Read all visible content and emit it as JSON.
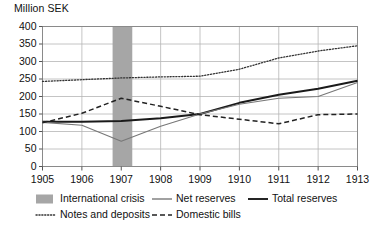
{
  "chart_data": {
    "type": "line",
    "title": "",
    "ylabel": "Million SEK",
    "xlabel": "",
    "ylim": [
      0,
      400
    ],
    "ytick_step": 50,
    "yticks": [
      0,
      50,
      100,
      150,
      200,
      250,
      300,
      350,
      400
    ],
    "xlim": [
      1905,
      1913
    ],
    "x": [
      1905,
      1906,
      1907,
      1908,
      1909,
      1910,
      1911,
      1912,
      1913
    ],
    "categories": [
      "1905",
      "1906",
      "1907",
      "1908",
      "1909",
      "1910",
      "1911",
      "1912",
      "1913"
    ],
    "grid": true,
    "grid_axis": "both",
    "legend_position": "bottom",
    "series": [
      {
        "name": "Notes and deposits",
        "style": "dotted",
        "color": "#333333",
        "values": [
          243,
          248,
          253,
          256,
          258,
          278,
          310,
          330,
          345
        ]
      },
      {
        "name": "Total reserves",
        "style": "solid-thick",
        "color": "#1a1a1a",
        "values": [
          128,
          128,
          130,
          138,
          150,
          182,
          205,
          222,
          245
        ]
      },
      {
        "name": "Net reserves",
        "style": "solid-thin",
        "color": "#777777",
        "values": [
          126,
          118,
          72,
          115,
          150,
          178,
          195,
          200,
          240
        ]
      },
      {
        "name": "Domestic bills",
        "style": "dashed",
        "color": "#222222",
        "values": [
          125,
          152,
          195,
          172,
          148,
          135,
          122,
          148,
          150
        ]
      }
    ],
    "bands": [
      {
        "name": "International crisis",
        "color": "#a6a6a6",
        "x_start": 1906.78,
        "x_end": 1907.28
      }
    ],
    "legend": [
      {
        "label": "International crisis",
        "marker": "swatch",
        "color": "#a6a6a6"
      },
      {
        "label": "Net reserves",
        "marker": "solid-thin",
        "color": "#555555"
      },
      {
        "label": "Total reserves",
        "marker": "solid-thick",
        "color": "#1a1a1a"
      },
      {
        "label": "Notes and deposits",
        "marker": "dotted",
        "color": "#333333"
      },
      {
        "label": "Domestic bills",
        "marker": "dashed",
        "color": "#222222"
      }
    ]
  },
  "axis": {
    "y_title": "Million SEK"
  }
}
